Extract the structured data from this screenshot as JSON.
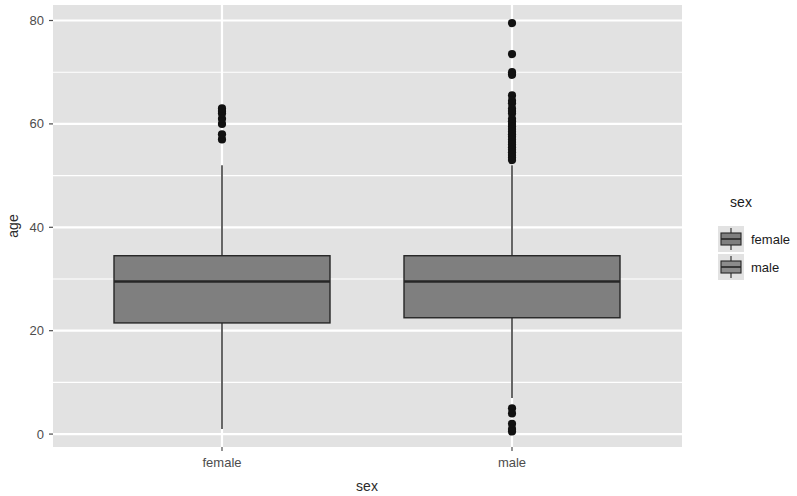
{
  "chart_data": {
    "type": "box",
    "title": "",
    "xlabel": "sex",
    "ylabel": "age",
    "categories": [
      "female",
      "male"
    ],
    "ylim": [
      -2.5,
      83
    ],
    "yticks": [
      0,
      20,
      40,
      60,
      80
    ],
    "ytick_labels": [
      "0",
      "20",
      "40",
      "60",
      "80"
    ],
    "yminor_ticks": [
      10,
      30,
      50,
      70
    ],
    "grid": true,
    "legend": {
      "title": "sex",
      "position": "right",
      "entries": [
        {
          "label": "female",
          "color": "#8c8c8c"
        },
        {
          "label": "male",
          "color": "#8c8c8c"
        }
      ]
    },
    "boxes": [
      {
        "name": "female",
        "x_label": "female",
        "min_whisker": 1,
        "q1": 21.5,
        "median": 29.5,
        "q3": 34.5,
        "max_whisker": 52,
        "outliers": [
          57,
          58,
          60,
          61,
          62,
          62.5,
          63
        ],
        "fill": "#7f7f7f",
        "stroke": "#262626"
      },
      {
        "name": "male",
        "x_label": "male",
        "min_whisker": 7,
        "q1": 22.5,
        "median": 29.5,
        "q3": 34.5,
        "max_whisker": 52,
        "outliers": [
          79.5,
          73.5,
          70,
          69.5,
          65.5,
          64.5,
          64,
          63,
          62.5,
          62,
          61,
          60.5,
          60,
          59.5,
          59,
          58.5,
          58,
          57.5,
          57,
          56.5,
          56,
          55.5,
          55,
          54.5,
          54,
          53.5,
          53,
          5,
          4,
          2,
          1,
          0.5
        ],
        "fill": "#7f7f7f",
        "stroke": "#262626"
      }
    ],
    "panel_background": "#e2e2e2",
    "gridline_color": "#ffffff",
    "axis_text_color": "#4d4d4d"
  },
  "axis": {
    "y_title": "age",
    "x_title": "sex",
    "y_tick_0": "0",
    "y_tick_20": "20",
    "y_tick_40": "40",
    "y_tick_60": "60",
    "y_tick_80": "80",
    "x_tick_female": "female",
    "x_tick_male": "male"
  },
  "legend": {
    "title": "sex",
    "item_female": "female",
    "item_male": "male"
  }
}
